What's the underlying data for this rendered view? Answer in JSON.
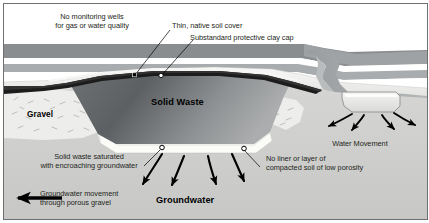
{
  "figure": {
    "type": "cross-section-diagram",
    "frame": {
      "border_color": "#6f6f6f",
      "background": "#ffffff"
    }
  },
  "palette": {
    "sky": "#ffffff",
    "distant_hill": "#8a8d8f",
    "topsoil_band": "#a9acae",
    "native_soil_cover": "#f2f2f0",
    "clay_cap": "#1c1c1c",
    "solid_waste_dark": "#5b5e60",
    "solid_waste_light": "#9a9c9e",
    "gravel": "#ededeb",
    "subsurface": "#cfd0cf",
    "saturated_zone": "#fbfbf8",
    "water": "#9fa3a5",
    "pond": "#e4e5e3",
    "arrow": "#000000",
    "text": "#231f20"
  },
  "labels": {
    "no_monitoring_wells": {
      "line1": "No monitoring wells",
      "line2": "for gas or water quality"
    },
    "thin_native_soil_cover": "Thin, native soil cover",
    "substandard_clay_cap": "Substandard protective clay cap",
    "solid_waste_saturated": {
      "line1": "Solid waste saturated",
      "line2": "with encroaching groundwater"
    },
    "no_liner": {
      "line1": "No liner or layer of",
      "line2": "compacted soil of low porosity"
    },
    "water_movement": "Water Movement",
    "groundwater_movement": {
      "line1": "Groundwater movement",
      "line2": "through porous gravel"
    }
  },
  "strata_labels": {
    "gravel": "Gravel",
    "solid_waste": "Solid Waste",
    "groundwater": "Groundwater"
  },
  "markers": {
    "cap_marker_square": "filled-square-marker",
    "cap_marker_circle": "open-circle-marker",
    "base_marker_left": "open-circle-marker",
    "base_marker_right": "open-circle-marker"
  },
  "icons": {
    "leader_line": "leader-line",
    "groundwater_flow_arrow": "curved-arrow-down-left",
    "water_movement_arrow": "curved-arrow-down-out",
    "bulk_flow_arrow": "straight-arrow-left"
  }
}
